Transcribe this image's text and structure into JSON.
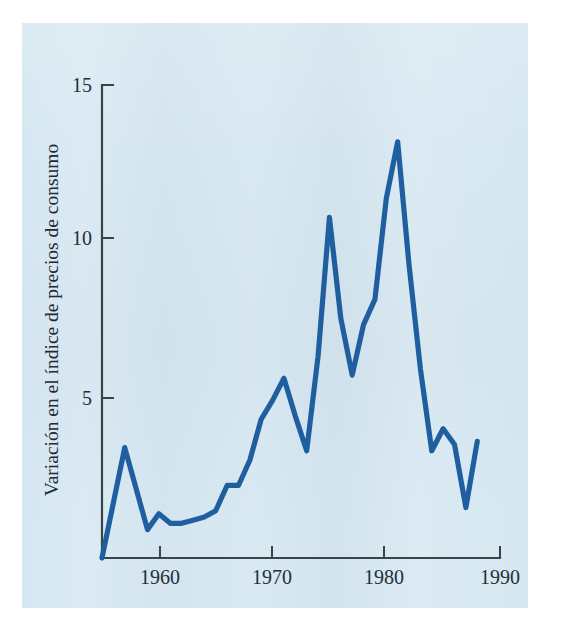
{
  "figure": {
    "background_color": "#ffffff",
    "panel_color": "#d7e8f2",
    "line_color": "#1f5fa0",
    "axis_color": "#3a4348"
  },
  "chart_data": {
    "type": "line",
    "title": "",
    "subtitle": "",
    "xlabel": "",
    "ylabel": "Variación en el índice de precios de consumo",
    "xlim": [
      1955,
      1990
    ],
    "ylim": [
      0,
      15
    ],
    "grid": false,
    "legend": null,
    "x_ticks": [
      1960,
      1970,
      1980,
      1990
    ],
    "x_tick_labels": [
      "1960",
      "1970",
      "1980",
      "1990"
    ],
    "y_ticks": [
      5,
      10,
      15
    ],
    "y_tick_labels": [
      "5",
      "10",
      "15"
    ],
    "series": [
      {
        "name": "Variación en el índice de precios de consumo",
        "color": "#1f5fa0",
        "x": [
          1955,
          1957,
          1959,
          1960,
          1961,
          1962,
          1963,
          1964,
          1965,
          1966,
          1967,
          1968,
          1969,
          1970,
          1971,
          1972,
          1973,
          1974,
          1975,
          1976,
          1977,
          1978,
          1979,
          1980,
          1981,
          1982,
          1983,
          1984,
          1985,
          1986,
          1987,
          1988
        ],
        "y": [
          0.0,
          3.5,
          0.9,
          1.4,
          1.1,
          1.1,
          1.2,
          1.3,
          1.5,
          2.3,
          2.3,
          3.1,
          4.4,
          5.0,
          5.7,
          4.5,
          3.4,
          6.4,
          10.8,
          7.6,
          5.8,
          7.4,
          8.2,
          11.4,
          13.2,
          9.3,
          6.0,
          3.4,
          4.1,
          3.6,
          1.6,
          3.7
        ]
      }
    ],
    "annotations": []
  },
  "axes": {
    "y_axis_label": "Variación en el índice de precios de consumo",
    "y_tick_15": "15",
    "y_tick_10": "10",
    "y_tick_5": "5",
    "x_tick_1960": "1960",
    "x_tick_1970": "1970",
    "x_tick_1980": "1980",
    "x_tick_1990": "1990"
  }
}
